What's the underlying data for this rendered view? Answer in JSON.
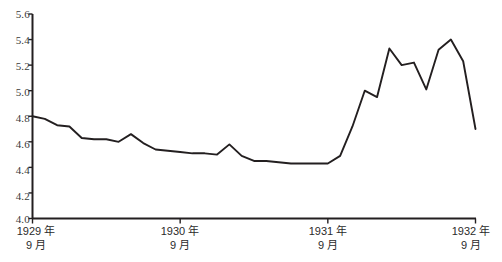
{
  "chart_data": {
    "type": "line",
    "title": "",
    "subtitle": "",
    "xlabel": "",
    "ylabel": "",
    "ylim": [
      4.0,
      5.6
    ],
    "ytick_step": 0.2,
    "yticks": [
      "5.6",
      "5.4",
      "5.2",
      "5.0",
      "4.8",
      "4.6",
      "4.4",
      "4.2",
      "4.0"
    ],
    "xticks": [
      {
        "line1": "1929 年",
        "line2": "9 月"
      },
      {
        "line1": "1930 年",
        "line2": "9 月"
      },
      {
        "line1": "1931 年",
        "line2": "9 月"
      },
      {
        "line1": "1932 年",
        "line2": "9 月"
      }
    ],
    "grid": false,
    "legend": "none",
    "line_color": "#231f20",
    "axis_color": "#231f20",
    "x": [
      0,
      1,
      2,
      3,
      4,
      5,
      6,
      7,
      8,
      9,
      10,
      11,
      12,
      13,
      14,
      15,
      16,
      17,
      18,
      19,
      20,
      21,
      22,
      23,
      24,
      25,
      26,
      27,
      28,
      29,
      30,
      31,
      32,
      33,
      34,
      35,
      36
    ],
    "x_labels": [
      "1929-09",
      "1929-10",
      "1929-11",
      "1929-12",
      "1930-01",
      "1930-02",
      "1930-03",
      "1930-04",
      "1930-05",
      "1930-06",
      "1930-07",
      "1930-08",
      "1930-09",
      "1930-10",
      "1930-11",
      "1930-12",
      "1931-01",
      "1931-02",
      "1931-03",
      "1931-04",
      "1931-05",
      "1931-06",
      "1931-07",
      "1931-08",
      "1931-09",
      "1931-10",
      "1931-11",
      "1931-12",
      "1932-01",
      "1932-02",
      "1932-03",
      "1932-04",
      "1932-05",
      "1932-06",
      "1932-07",
      "1932-08",
      "1932-09"
    ],
    "values": [
      4.8,
      4.78,
      4.73,
      4.72,
      4.63,
      4.62,
      4.62,
      4.6,
      4.66,
      4.59,
      4.54,
      4.53,
      4.52,
      4.51,
      4.51,
      4.5,
      4.58,
      4.49,
      4.45,
      4.45,
      4.44,
      4.43,
      4.43,
      4.43,
      4.43,
      4.49,
      4.72,
      5.0,
      4.95,
      5.33,
      5.2,
      5.22,
      5.01,
      5.32,
      5.4,
      5.23,
      4.7
    ],
    "series_name": ""
  }
}
